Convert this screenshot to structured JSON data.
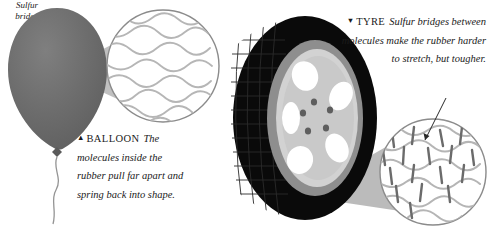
{
  "figure": {
    "title_hidden": "",
    "background": "#ffffff"
  },
  "balloon_panel": {
    "name": "balloon-illustration",
    "caption": {
      "marker": "▲",
      "lead": "BALLOON",
      "body": "The molecules inside the rubber pull far apart and spring back into shape."
    },
    "colors": {
      "balloon_body": "#6a6a6a",
      "balloon_highlight": "#7d7d7d",
      "cone": "#a8a8a8",
      "string": "#8f8f8f",
      "circle_outline": "#8b8b8b",
      "chain": "#b3b3b3"
    },
    "magnifier": {
      "label": "loose-polymer-chains",
      "chain_count": 9,
      "bridges": 0
    }
  },
  "tyre_panel": {
    "name": "tyre-illustration",
    "caption": {
      "marker": "▼",
      "lead": "TYRE",
      "body": "Sulfur bridges between molecules make the rubber harder to stretch, but tougher."
    },
    "annotation": {
      "label": "Sulfur bridge",
      "line1": "Sulfur",
      "line2": "bridge"
    },
    "colors": {
      "tread": "#0a0a0a",
      "tread_groove": "#242424",
      "rim_outer": "#8e8e8e",
      "rim_inner": "#d2d2d2",
      "hub": "#c9c9c9",
      "spoke_hole": "#ffffff",
      "lug_bolt": "#5e5e5e",
      "cone": "#a8a8a8",
      "circle_outline": "#8b8b8b",
      "chain": "#b5b5b5",
      "bridge": "#6b6b6b"
    },
    "wheel": {
      "spoke_holes": 5,
      "lug_bolts": 5
    },
    "magnifier": {
      "label": "cross-linked-polymer-chains",
      "chain_count": 8,
      "bridges": 17
    }
  }
}
